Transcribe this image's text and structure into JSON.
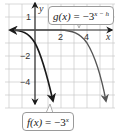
{
  "graph": {
    "axis_labels": {
      "x": "x",
      "y": "y"
    },
    "x_ticks": [
      {
        "value": 2,
        "label": "2"
      },
      {
        "value": 4,
        "label": "4"
      }
    ],
    "y_ticks": [
      {
        "value": 1,
        "label": "1"
      },
      {
        "value": -2,
        "label": "−2"
      },
      {
        "value": -4,
        "label": "−4"
      }
    ],
    "curves": [
      {
        "name": "f",
        "equation_lhs": "f(x)",
        "equals": "=",
        "base": "−3",
        "exponent": "x",
        "color": "#1a1a1a"
      },
      {
        "name": "g",
        "equation_lhs": "g(x)",
        "equals": "=",
        "base": "−3",
        "exponent": "x − h",
        "color": "#555555"
      }
    ],
    "colors": {
      "grid": "#c8c8c8",
      "axis": "#222222",
      "callout_border": "#9a9a9a"
    }
  }
}
